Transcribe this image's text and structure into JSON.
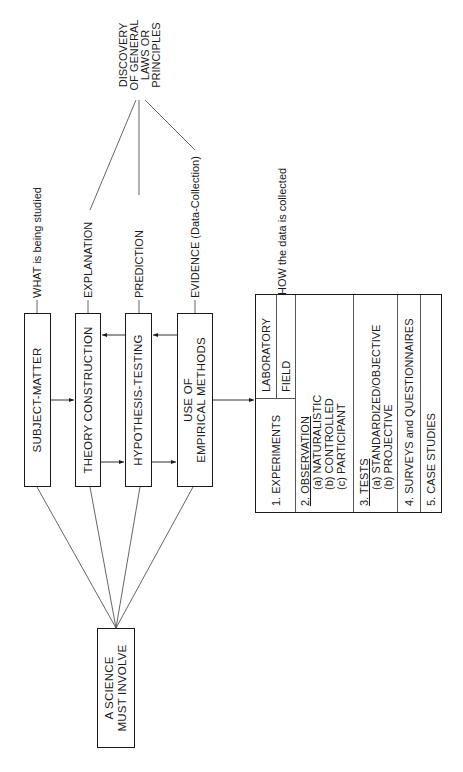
{
  "diagram": {
    "orientation": "rotated 90 degrees counter-clockwise",
    "root": {
      "label_line1": "A SCIENCE",
      "label_line2": "MUST INVOLVE"
    },
    "components": [
      {
        "label": "SUBJECT-MATTER",
        "annotation": "WHAT is being studied"
      },
      {
        "label": "THEORY CONSTRUCTION",
        "annotation": "EXPLANATION"
      },
      {
        "label": "HYPOTHESIS-TESTING",
        "annotation": "PREDICTION"
      },
      {
        "label_line1": "USE OF",
        "label_line2": "EMPIRICAL METHODS",
        "annotation": "EVIDENCE (Data-Collection)"
      }
    ],
    "goal": {
      "line1": "DISCOVERY",
      "line2": "OF GENERAL",
      "line3": "LAWS OR",
      "line4": "PRINCIPLES"
    },
    "methods_annotation": "HOW the data is collected",
    "methods": {
      "experiments": {
        "label": "1. EXPERIMENTS",
        "sub": [
          "LABORATORY",
          "FIELD"
        ]
      },
      "observation": {
        "label": "2. OBSERVATION",
        "sub": [
          "(a) NATURALISTIC",
          "(b) CONTROLLED",
          "(c) PARTICIPANT"
        ]
      },
      "tests": {
        "label": "3. TESTS",
        "sub": [
          "(a) STANDARDIZED/OBJECTIVE",
          "(b) PROJECTIVE"
        ]
      },
      "surveys": {
        "label": "4. SURVEYS and QUESTIONNAIRES"
      },
      "case_studies": {
        "label": "5. CASE STUDIES"
      }
    },
    "colors": {
      "ink": "#1a1a1a",
      "line": "#555555",
      "background": "#ffffff"
    }
  }
}
